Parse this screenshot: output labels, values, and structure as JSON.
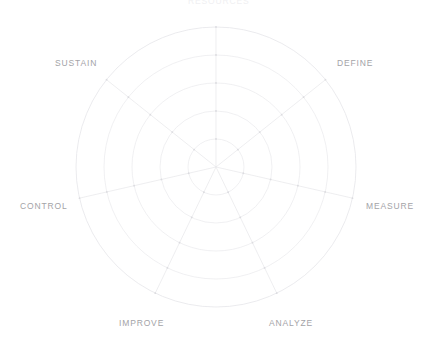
{
  "chart_data": {
    "type": "radar",
    "title": "RESOURCES",
    "title_visibility": "clipped-at-top-edge",
    "subtitle": "",
    "xlabel": "",
    "ylabel": "",
    "grid": true,
    "grid_shape": "circular",
    "grid_levels": 5,
    "legend_position": "none",
    "axis_range": [
      0,
      5
    ],
    "categories": [
      "RESOURCES",
      "DEFINE",
      "MEASURE",
      "ANALYZE",
      "IMPROVE",
      "CONTROL",
      "SUSTAIN"
    ],
    "series": [
      {
        "name": "",
        "values": [
          0,
          0,
          0,
          0,
          0,
          0,
          0
        ]
      }
    ],
    "tick_labels": [],
    "annotations": []
  },
  "chart": {
    "center_x": 216,
    "center_y": 167,
    "outer_radius": 140,
    "num_axes": 7,
    "num_rings": 5,
    "start_angle_deg": -90,
    "colors": {
      "grid_line": "#e9e9ec",
      "spoke_line": "#e6e6ea",
      "vertex_dot": "#dcdce0",
      "label_text": "#a3a3a7",
      "background": "#ffffff"
    }
  },
  "labels": {
    "top": {
      "text": "RESOURCES",
      "x": 188,
      "y": -4
    },
    "define": {
      "text": "DEFINE",
      "x": 337,
      "y": 58
    },
    "measure": {
      "text": "MEASURE",
      "x": 366,
      "y": 201
    },
    "analyze": {
      "text": "ANALYZE",
      "x": 269,
      "y": 318
    },
    "improve": {
      "text": "IMPROVE",
      "x": 119,
      "y": 318
    },
    "control": {
      "text": "CONTROL",
      "x": 20,
      "y": 201
    },
    "sustain": {
      "text": "SUSTAIN",
      "x": 55,
      "y": 58
    }
  }
}
